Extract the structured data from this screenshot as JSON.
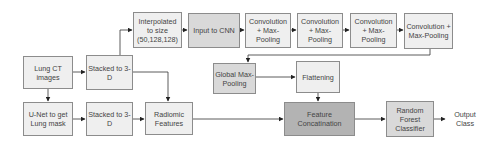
{
  "diagram": {
    "nodes": [
      {
        "id": "lung_ct",
        "label": "Lung CT images"
      },
      {
        "id": "stacked_1",
        "label": "Stacked to 3-D"
      },
      {
        "id": "unet",
        "label": "U-Net to get Lung mask"
      },
      {
        "id": "stacked_2",
        "label": "Stacked to 3-D"
      },
      {
        "id": "interpolated",
        "label": "Interpolated to size (50,128,128)"
      },
      {
        "id": "input_cnn",
        "label": "Input to CNN"
      },
      {
        "id": "conv_1",
        "label": "Convolution + Max-Pooling"
      },
      {
        "id": "conv_2",
        "label": "Convolution + Max-Pooling"
      },
      {
        "id": "conv_3",
        "label": "Convolution + Max-Pooling"
      },
      {
        "id": "conv_4",
        "label": "Convolution + Max-Pooling"
      },
      {
        "id": "global_pool",
        "label": "Global Max-Pooling"
      },
      {
        "id": "flattening",
        "label": "Flattening"
      },
      {
        "id": "radiomic",
        "label": "Radiomic Features"
      },
      {
        "id": "concat",
        "label": "Feature Concatination"
      },
      {
        "id": "rf",
        "label": "Random Forest Classifier"
      },
      {
        "id": "output",
        "label": "Output Class"
      }
    ],
    "edges": [
      [
        "lung_ct",
        "stacked_1"
      ],
      [
        "lung_ct",
        "unet"
      ],
      [
        "unet",
        "stacked_2"
      ],
      [
        "stacked_1",
        "interpolated"
      ],
      [
        "stacked_1",
        "radiomic"
      ],
      [
        "stacked_2",
        "radiomic"
      ],
      [
        "interpolated",
        "input_cnn"
      ],
      [
        "input_cnn",
        "conv_1"
      ],
      [
        "conv_1",
        "conv_2"
      ],
      [
        "conv_2",
        "conv_3"
      ],
      [
        "conv_3",
        "conv_4"
      ],
      [
        "conv_4",
        "global_pool"
      ],
      [
        "global_pool",
        "flattening"
      ],
      [
        "flattening",
        "concat"
      ],
      [
        "radiomic",
        "concat"
      ],
      [
        "concat",
        "rf"
      ],
      [
        "rf",
        "output"
      ]
    ]
  }
}
